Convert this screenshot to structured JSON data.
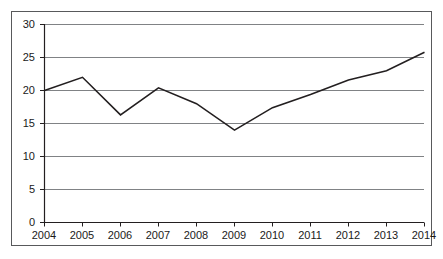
{
  "chart_data": {
    "type": "line",
    "title": "",
    "subtitle": "",
    "xlabel": "",
    "ylabel": "",
    "categories": [
      "2004",
      "2005",
      "2006",
      "2007",
      "2008",
      "2009",
      "2010",
      "2011",
      "2012",
      "2013",
      "2014"
    ],
    "values": [
      20.0,
      22.0,
      16.3,
      20.4,
      18.0,
      14.0,
      17.4,
      19.4,
      21.6,
      23.0,
      25.8
    ],
    "series": [
      {
        "name": "",
        "values": [
          20.0,
          22.0,
          16.3,
          20.4,
          18.0,
          14.0,
          17.4,
          19.4,
          21.6,
          23.0,
          25.8
        ]
      }
    ],
    "ylim": [
      0,
      30
    ],
    "yticks": [
      0,
      5,
      10,
      15,
      20,
      25,
      30
    ],
    "ytick_labels": [
      "0",
      "5",
      "10",
      "15",
      "20",
      "25",
      "30"
    ],
    "xtick_labels": [
      "2004",
      "2005",
      "2006",
      "2007",
      "2008",
      "2009",
      "2010",
      "2011",
      "2012",
      "2013",
      "2014"
    ],
    "grid": "horizontal",
    "legend": "none",
    "line_color": "#231f20",
    "grid_color": "#808285",
    "axis_color": "#231f20",
    "frame_color": "#58595b",
    "background_color": "#ffffff",
    "annotations": []
  }
}
